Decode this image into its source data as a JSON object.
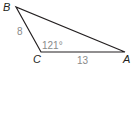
{
  "diagram": {
    "type": "triangle",
    "vertices": {
      "B": {
        "label": "B",
        "x": 16,
        "y": 7
      },
      "C": {
        "label": "C",
        "x": 41,
        "y": 52
      },
      "A": {
        "label": "A",
        "x": 125,
        "y": 52
      }
    },
    "sides": {
      "BC": {
        "label": "8"
      },
      "CA": {
        "label": "13"
      }
    },
    "angles": {
      "C": {
        "label": "121°"
      }
    },
    "colors": {
      "line": "#231f20",
      "measure_text": "#8a8a8a",
      "vertex_text": "#231f20"
    }
  }
}
